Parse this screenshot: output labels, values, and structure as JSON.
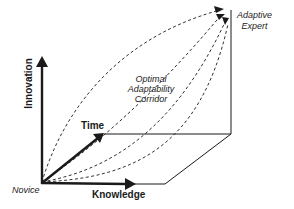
{
  "diagram": {
    "axes": {
      "innovation": "Innovation",
      "knowledge": "Knowledge",
      "time": "Time"
    },
    "start_label": "Novice",
    "end_label_line1": "Adaptive",
    "end_label_line2": "Expert",
    "corridor_line1": "Optimal",
    "corridor_line2": "Adaptability",
    "corridor_line3": "Corridor",
    "colors": {
      "ink": "#1a1a1a",
      "background": "#ffffff"
    }
  }
}
